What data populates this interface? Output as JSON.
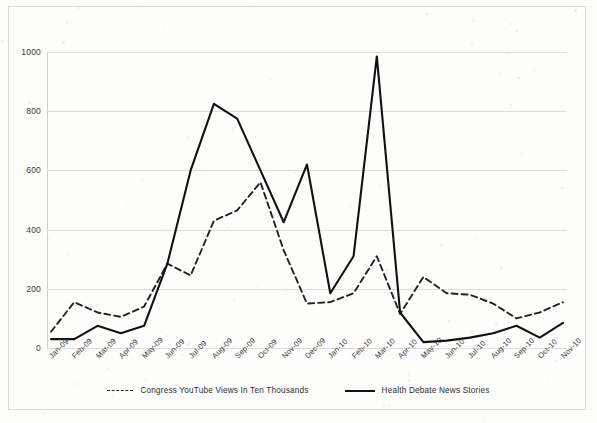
{
  "chart_data": {
    "type": "line",
    "title": "",
    "subtitle": "",
    "xlabel": "",
    "ylabel": "",
    "ylim": [
      0,
      1000
    ],
    "yticks": [
      0,
      200,
      400,
      600,
      800,
      1000
    ],
    "grid": true,
    "legend_position": "bottom",
    "categories": [
      "Jan-09",
      "Feb-09",
      "Mar-09",
      "Apr-09",
      "May-09",
      "Jun-09",
      "Jul-09",
      "Aug-09",
      "Sep-09",
      "Oct-09",
      "Nov-09",
      "Dec-09",
      "Jan-10",
      "Feb-10",
      "Mar-10",
      "Apr-10",
      "May-10",
      "Jun-10",
      "Jul-10",
      "Aug-10",
      "Sep-10",
      "Oct-10",
      "Nov-10"
    ],
    "series": [
      {
        "name": "Congress YouTube Views In Ten Thousands",
        "style": "dashed",
        "color": "#222222",
        "values": [
          55,
          155,
          120,
          105,
          140,
          285,
          245,
          430,
          465,
          560,
          330,
          150,
          155,
          185,
          310,
          115,
          240,
          185,
          180,
          150,
          100,
          120,
          155
        ]
      },
      {
        "name": "Health Debate News Stories",
        "style": "solid",
        "color": "#111111",
        "values": [
          30,
          30,
          75,
          50,
          75,
          285,
          600,
          825,
          775,
          600,
          425,
          620,
          185,
          310,
          985,
          120,
          20,
          25,
          35,
          50,
          75,
          35,
          85
        ]
      }
    ]
  },
  "axis": {
    "y_tick_labels": [
      "1000",
      "800",
      "600",
      "400",
      "200",
      "0"
    ],
    "x_tick_labels": [
      "Jan-09",
      "Feb-09",
      "Mar-09",
      "Apr-09",
      "May-09",
      "Jun-09",
      "Jul-09",
      "Aug-09",
      "Sep-09",
      "Oct-09",
      "Nov-09",
      "Dec-09",
      "Jan-10",
      "Feb-10",
      "Mar-10",
      "Apr-10",
      "May-10",
      "Jun-10",
      "Jul-10",
      "Aug-10",
      "Sep-10",
      "Oct-10",
      "Nov-10"
    ]
  },
  "legend": {
    "items": [
      {
        "label": "Congress YouTube Views In Ten Thousands",
        "marker": "dashed-line-swatch"
      },
      {
        "label": "Health Debate News Stories",
        "marker": "solid-line-swatch"
      }
    ]
  }
}
